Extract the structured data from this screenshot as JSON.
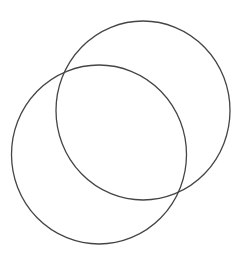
{
  "diagram": {
    "type": "venn",
    "background": "#ffffff",
    "stroke_color": "#454545",
    "stroke_width": 1.3,
    "shapes": [
      {
        "name": "circle-top-right",
        "cx": 143,
        "cy": 110.5,
        "rx": 87,
        "ry": 89.5
      },
      {
        "name": "circle-bottom-left",
        "cx": 99,
        "cy": 154.5,
        "rx": 87.5,
        "ry": 89.5
      }
    ]
  }
}
